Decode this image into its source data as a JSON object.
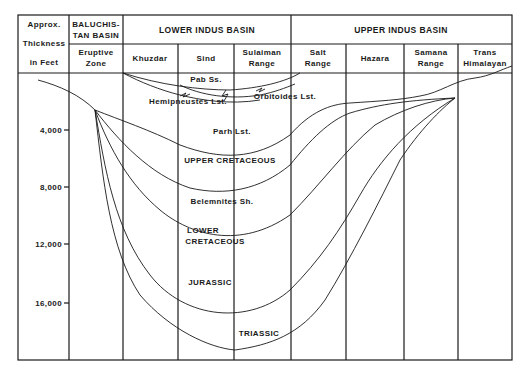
{
  "diagram": {
    "header": {
      "axis_label_lines": [
        "Approx.",
        "Thickness",
        "in Feet"
      ],
      "groups": [
        {
          "lines": [
            "BALUCHIS-",
            "TAN BASIN"
          ]
        },
        {
          "lines": [
            "LOWER INDUS BASIN"
          ]
        },
        {
          "lines": [
            "UPPER INDUS BASIN"
          ]
        }
      ],
      "columns": [
        {
          "lines": [
            "Eruptive",
            "Zone"
          ]
        },
        {
          "lines": [
            "Khuzdar"
          ]
        },
        {
          "lines": [
            "Sind"
          ]
        },
        {
          "lines": [
            "Sulaiman",
            "Range"
          ]
        },
        {
          "lines": [
            "Salt",
            "Range"
          ]
        },
        {
          "lines": [
            "Hazara"
          ]
        },
        {
          "lines": [
            "Samana",
            "Range"
          ]
        },
        {
          "lines": [
            "Trans",
            "Himalayan"
          ]
        }
      ]
    },
    "y_axis": {
      "ticks": [
        "4,000",
        "8,000",
        "12,000",
        "16,000"
      ],
      "unit": "Feet"
    },
    "formation_labels": [
      "Pab Ss.",
      "Hemipneustes Lst.",
      "Orbitoides Lst.",
      "Parh Lst.",
      "UPPER CRETACEOUS",
      "Belemnites Sh.",
      "LOWER",
      "CRETACEOUS",
      "JURASSIC",
      "TRIASSIC"
    ],
    "colors": {
      "ink": "#1a1a1a",
      "background": "#ffffff"
    }
  }
}
